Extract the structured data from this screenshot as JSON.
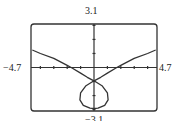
{
  "window": {
    "ymax_label": "3.1",
    "ymin_label": "−3.1",
    "xmin_label": "−4.7",
    "xmax_label": "4.7"
  },
  "chart_data": {
    "type": "line",
    "title": "",
    "xlabel": "",
    "ylabel": "",
    "xlim": [
      -4.7,
      4.7
    ],
    "ylim": [
      -3.1,
      3.1
    ],
    "grid": false,
    "x_tick_step": 1,
    "y_tick_step": 1,
    "series": [
      {
        "name": "left branch",
        "x": [
          -4.6,
          -4.0,
          -3.0,
          -2.0,
          -1.7,
          -1.0,
          -0.5,
          0.0
        ],
        "y": [
          1.25,
          1.0,
          0.65,
          0.15,
          0.0,
          -0.4,
          -0.7,
          -0.95
        ]
      },
      {
        "name": "right branch",
        "x": [
          0.0,
          0.5,
          1.0,
          1.7,
          2.0,
          3.0,
          4.0,
          4.6
        ],
        "y": [
          -0.95,
          -0.7,
          -0.4,
          0.0,
          0.15,
          0.65,
          1.0,
          1.25
        ]
      },
      {
        "name": "loop",
        "x": [
          0.0,
          -0.6,
          -1.0,
          -1.05,
          -0.8,
          -0.3,
          0.0,
          0.3,
          0.8,
          1.05,
          1.0,
          0.6,
          0.0
        ],
        "y": [
          -0.95,
          -1.3,
          -1.8,
          -2.3,
          -2.7,
          -2.9,
          -2.92,
          -2.9,
          -2.7,
          -2.3,
          -1.8,
          -1.3,
          -0.95
        ]
      }
    ]
  }
}
